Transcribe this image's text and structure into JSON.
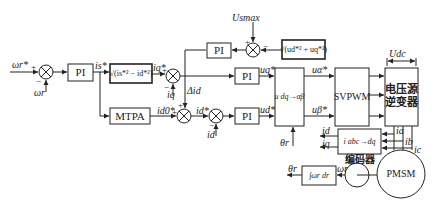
{
  "diagram": {
    "blocks": {
      "pi_speed": "PI",
      "sqrt_current": "√(is*² − id*²)",
      "mtpa": "MTPA",
      "pi_voltage": "PI",
      "sqrt_voltage": "√(ud*² + uq*²)",
      "pi_q": "PI",
      "pi_d": "PI",
      "dq_to_ab": "u dq→αβ",
      "svpwm": "SVPWM",
      "inverter": "电压源\n逆变器",
      "abc_to_dq": "i abc→dq",
      "integrator": "∫ωr dr",
      "motor": "PMSM",
      "encoder_label": "编码器"
    },
    "signals": {
      "speed_ref": "ωr*",
      "speed_fb": "ωr",
      "is_ref": "is*",
      "iq_ref": "iq*",
      "iq_fb": "iq",
      "id0_ref": "id0*",
      "id_ref": "id*",
      "id_fb": "id",
      "delta_id": "Δid",
      "uq_ref": "uq*",
      "ud_ref": "ud*",
      "ualpha_ref": "uα*",
      "ubeta_ref": "uβ*",
      "theta_in": "θr",
      "theta_out": "θr",
      "omega_enc": "ωr",
      "usmax": "Usmax",
      "udc": "Udc",
      "ia": "ia",
      "ib": "ib",
      "ic": "ic",
      "id_out": "id",
      "iq_out": "iq"
    },
    "signs": {
      "plus": "+",
      "minus": "−"
    }
  }
}
